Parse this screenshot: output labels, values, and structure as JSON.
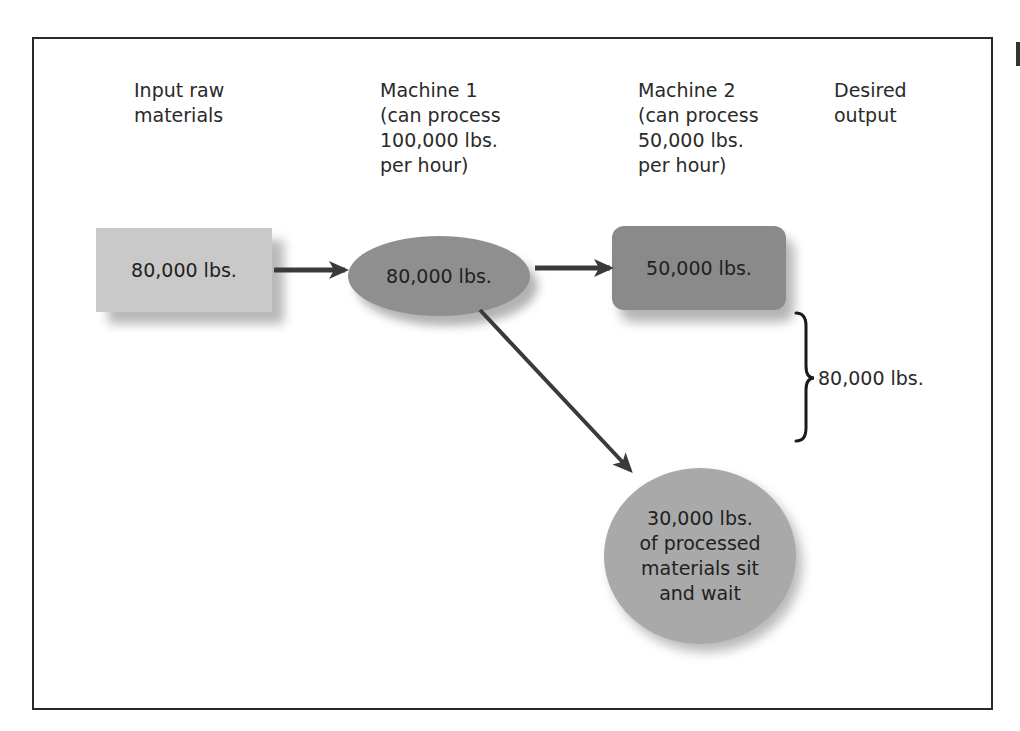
{
  "diagram": {
    "type": "process-flow",
    "columns": [
      {
        "id": "input",
        "label_lines": [
          "Input raw",
          "materials"
        ]
      },
      {
        "id": "machine1",
        "label_lines": [
          "Machine 1",
          "(can process",
          "100,000 lbs.",
          "per hour)"
        ]
      },
      {
        "id": "machine2",
        "label_lines": [
          "Machine 2",
          "(can process",
          "50,000 lbs.",
          "per hour)"
        ]
      },
      {
        "id": "output",
        "label_lines": [
          "Desired",
          "output"
        ]
      }
    ],
    "nodes": {
      "input": {
        "shape": "rectangle",
        "text": "80,000 lbs.",
        "fill": "#c9c9c9"
      },
      "machine1": {
        "shape": "ellipse",
        "text": "80,000 lbs.",
        "fill": "#8f8f8f"
      },
      "machine2": {
        "shape": "rounded-rectangle",
        "text": "50,000 lbs.",
        "fill": "#8a8a8a"
      },
      "waiting": {
        "shape": "circle",
        "text_lines": [
          "30,000 lbs.",
          "of processed",
          "materials sit",
          "and wait"
        ],
        "fill": "#a9a9a9"
      }
    },
    "edges": [
      {
        "from": "input",
        "to": "machine1"
      },
      {
        "from": "machine1",
        "to": "machine2"
      },
      {
        "from": "machine1",
        "to": "waiting"
      }
    ],
    "brace": {
      "label": "80,000 lbs.",
      "spans": [
        "machine2",
        "waiting"
      ]
    },
    "colors": {
      "arrow": "#3a3a3a",
      "frame": "#2a2a2a",
      "text": "#222222"
    }
  }
}
